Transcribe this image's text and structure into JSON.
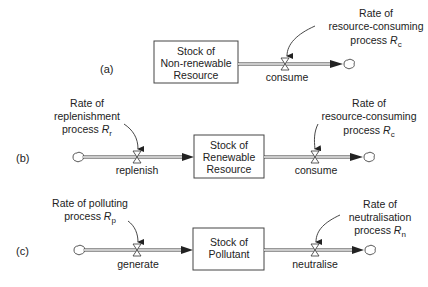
{
  "diagram": {
    "type": "stock-and-flow",
    "panels": [
      {
        "id": "a",
        "label": "(a)",
        "stock": {
          "line1": "Stock of",
          "line2": "Non-renewable",
          "line3": "Resource"
        },
        "outflow": {
          "name": "consume",
          "rate": {
            "line1": "Rate of",
            "line2": "resource-consuming",
            "line3_prefix": "process ",
            "symbol": "R",
            "subscript": "c"
          }
        }
      },
      {
        "id": "b",
        "label": "(b)",
        "stock": {
          "line1": "Stock of",
          "line2": "Renewable",
          "line3": "Resource"
        },
        "inflow": {
          "name": "replenish",
          "rate": {
            "line1": "Rate of",
            "line2": "replenishment",
            "line3_prefix": "process ",
            "symbol": "R",
            "subscript": "r"
          }
        },
        "outflow": {
          "name": "consume",
          "rate": {
            "line1": "Rate of",
            "line2": "resource-consuming",
            "line3_prefix": "process ",
            "symbol": "R",
            "subscript": "c"
          }
        }
      },
      {
        "id": "c",
        "label": "(c)",
        "stock": {
          "line1": "Stock of",
          "line2": "Pollutant"
        },
        "inflow": {
          "name": "generate",
          "rate": {
            "line1": "Rate of polluting",
            "line2_prefix": "process ",
            "symbol": "R",
            "subscript": "p"
          }
        },
        "outflow": {
          "name": "neutralise",
          "rate": {
            "line1": "Rate of",
            "line2": "neutralisation",
            "line3_prefix": "process ",
            "symbol": "R",
            "subscript": "n"
          }
        }
      }
    ]
  }
}
